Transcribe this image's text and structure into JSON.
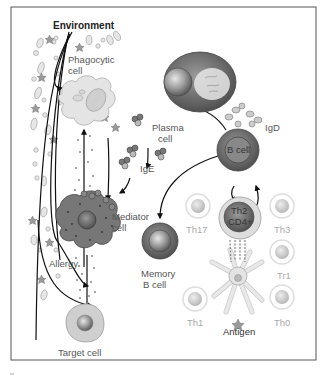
{
  "figure": {
    "title": "Environment",
    "labels": {
      "phagocytic_cell": [
        "Phagocytic",
        "cell"
      ],
      "plasma_cell": [
        "Plasma",
        "cell"
      ],
      "igd": "IgD",
      "b_cell": "B cell",
      "ige": "IgE",
      "mediator_cell": [
        "Mediator",
        "cell"
      ],
      "allergy": "Allergy",
      "memory_b_cell": [
        "Memory",
        "B cell"
      ],
      "th2_cd4": [
        "Th2",
        "CD4+"
      ],
      "th17": "Th17",
      "th3": "Th3",
      "tr1": "Tr1",
      "th1": "Th1",
      "th0": "Th0",
      "antigen": "Antigen",
      "target_cell": "Target cell"
    },
    "colors": {
      "border": "#555555",
      "cell_dark": "#6b6b6b",
      "cell_mid": "#9a9a9a",
      "cell_light": "#d8d8d8",
      "arrow": "#111111"
    }
  }
}
